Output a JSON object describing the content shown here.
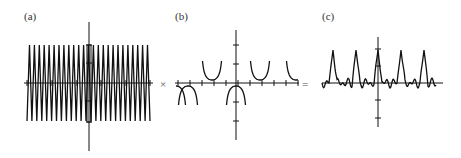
{
  "figure": {
    "panels": [
      {
        "id": "a",
        "label": "(a)",
        "description": "sawtooth / triangle wave with rectangular window on vertical axis"
      },
      {
        "id": "b",
        "label": "(b)",
        "description": "secant-like function with vertical asymptotes"
      },
      {
        "id": "c",
        "label": "(c)",
        "description": "product: periodic sharp peaks on oscillating baseline"
      }
    ],
    "operators": {
      "multiply": "×",
      "equals": "="
    },
    "colors": {
      "stroke": "#111111",
      "axis": "#222222",
      "background": "#ffffff"
    }
  }
}
